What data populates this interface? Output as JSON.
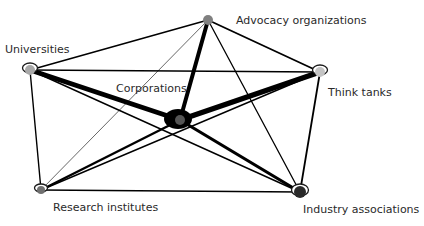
{
  "diagram": {
    "type": "network",
    "nodes": [
      {
        "id": "advocacy",
        "label": "Advocacy organizations",
        "x": 208,
        "y": 20,
        "r": 5,
        "fill": "#808080",
        "loop": false,
        "label_x": 236,
        "label_y": 24
      },
      {
        "id": "universities",
        "label": "Universities",
        "x": 30,
        "y": 70,
        "r": 5,
        "fill": "#a8a8a8",
        "loop": true,
        "label_x": 5,
        "label_y": 53
      },
      {
        "id": "thinktanks",
        "label": "Think tanks",
        "x": 320,
        "y": 72,
        "r": 5,
        "fill": "#c4c4c4",
        "loop": true,
        "label_x": 328,
        "label_y": 96
      },
      {
        "id": "corporations",
        "label": "Corporations",
        "x": 180,
        "y": 120,
        "r": 5,
        "fill": "#555555",
        "loop": false,
        "blob": true,
        "label_x": 116,
        "label_y": 92
      },
      {
        "id": "research",
        "label": "Research institutes",
        "x": 41,
        "y": 190,
        "r": 4,
        "fill": "#707070",
        "loop": true,
        "label_x": 53,
        "label_y": 211
      },
      {
        "id": "industry",
        "label": "Industry associations",
        "x": 300,
        "y": 192,
        "r": 6,
        "fill": "#2a2a2a",
        "loop": true,
        "label_x": 303,
        "label_y": 213
      }
    ],
    "edges": [
      {
        "source": "universities",
        "target": "advocacy",
        "width": 1.6
      },
      {
        "source": "universities",
        "target": "thinktanks",
        "width": 1.6
      },
      {
        "source": "universities",
        "target": "corporations",
        "width": 5
      },
      {
        "source": "universities",
        "target": "research",
        "width": 1.4
      },
      {
        "source": "universities",
        "target": "industry",
        "width": 1.4
      },
      {
        "source": "advocacy",
        "target": "thinktanks",
        "width": 1.8
      },
      {
        "source": "advocacy",
        "target": "corporations",
        "width": 4
      },
      {
        "source": "advocacy",
        "target": "research",
        "width": 0.6
      },
      {
        "source": "advocacy",
        "target": "industry",
        "width": 1.3
      },
      {
        "source": "thinktanks",
        "target": "corporations",
        "width": 5.5
      },
      {
        "source": "thinktanks",
        "target": "research",
        "width": 1.4
      },
      {
        "source": "thinktanks",
        "target": "industry",
        "width": 1.8
      },
      {
        "source": "corporations",
        "target": "research",
        "width": 2.4
      },
      {
        "source": "corporations",
        "target": "industry",
        "width": 3.2
      },
      {
        "source": "research",
        "target": "industry",
        "width": 1.6
      }
    ],
    "colors": {
      "edge": "#000000",
      "loop_stroke": "#1a1a1a",
      "blob": "#000000",
      "label": "#2a2a2a"
    }
  }
}
